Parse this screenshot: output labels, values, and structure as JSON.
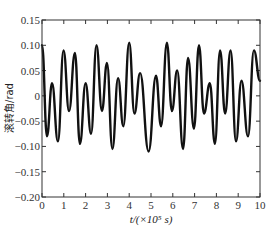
{
  "chart_data": {
    "type": "line",
    "title": "",
    "xlabel": "t/(×10⁵ s)",
    "ylabel": "滚转角/rad",
    "xlim": [
      0,
      10
    ],
    "ylim": [
      -0.2,
      0.15
    ],
    "x_ticks": [
      "0",
      "1",
      "2",
      "3",
      "4",
      "5",
      "6",
      "7",
      "8",
      "9",
      "10"
    ],
    "y_ticks": [
      "0.15",
      "0.10",
      "0.05",
      "0",
      "-0.05",
      "-0.10",
      "-0.15",
      "-0.20"
    ],
    "grid": false,
    "legend": null,
    "line_color": "#111111",
    "series": [
      {
        "name": "滚转角",
        "x": [
          0,
          0.23,
          0.46,
          0.73,
          0.99,
          1.24,
          1.51,
          1.74,
          2.0,
          2.25,
          2.5,
          2.75,
          2.98,
          3.23,
          3.49,
          3.73,
          4.0,
          4.24,
          4.5,
          4.89,
          5.23,
          5.46,
          5.73,
          5.96,
          6.2,
          6.47,
          6.7,
          6.97,
          7.2,
          7.43,
          7.7,
          7.93,
          8.17,
          8.4,
          8.65,
          8.9,
          9.15,
          9.45,
          9.72,
          10.0
        ],
        "values": [
          0.1,
          -0.08,
          0.025,
          -0.09,
          0.09,
          -0.03,
          0.085,
          -0.095,
          0.025,
          -0.075,
          0.1,
          -0.03,
          0.065,
          -0.105,
          0.035,
          -0.06,
          0.105,
          -0.035,
          0.045,
          -0.11,
          0.04,
          -0.06,
          0.105,
          -0.03,
          0.05,
          -0.105,
          0.075,
          -0.065,
          0.1,
          -0.035,
          0.025,
          -0.095,
          0.09,
          -0.035,
          0.09,
          -0.09,
          0.03,
          -0.08,
          0.09,
          0.03
        ]
      }
    ]
  }
}
